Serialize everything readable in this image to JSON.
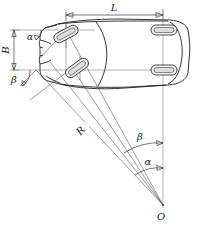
{
  "figure": {
    "type": "engineering-line-diagram",
    "view": "top view of automobile",
    "background_color": "#ffffff",
    "line_color": "#1f1f1f",
    "width_px": 202,
    "height_px": 234
  },
  "labels": {
    "wheelbase": "L",
    "track_width": "B",
    "turning_radius": "R",
    "inner_steer_angle": "β",
    "outer_steer_angle": "α",
    "inner_steer_angle_at_center": "β",
    "outer_steer_angle_at_center": "α",
    "turn_center": "O"
  },
  "geometry": {
    "turn_center_point": {
      "x": 163,
      "y": 205
    },
    "rear_axle_line_x": 163,
    "front_axle_left_end": {
      "x": 36,
      "y": 70
    },
    "wheelbase_dim_y": 15,
    "wheelbase_dim_x_start": 66,
    "wheelbase_dim_x_end": 163,
    "track_dim_x": 14,
    "track_dim_y_top": 30,
    "track_dim_y_bottom": 70
  },
  "elements": {
    "car_body": "automobile-outline-top-view",
    "front_left_wheel": "steered-wheel-outer",
    "front_right_wheel": "steered-wheel-inner",
    "rear_left_wheel": "fixed-wheel-rear-left",
    "rear_right_wheel": "fixed-wheel-rear-right",
    "radius_ray": "turning-radius-line",
    "rear_axis": "rear-axle-centerline",
    "front_axis": "front-axle-centerline"
  }
}
